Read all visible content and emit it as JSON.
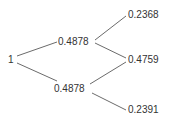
{
  "tree": {
    "root": {
      "label": "1"
    },
    "level1": [
      {
        "label": "0.4878"
      },
      {
        "label": "0.4878"
      }
    ],
    "level2": [
      {
        "label": "0.2368"
      },
      {
        "label": "0.4759"
      },
      {
        "label": "0.2391"
      }
    ],
    "edge_color": "#6b6b6b",
    "text_color": "#333333"
  }
}
